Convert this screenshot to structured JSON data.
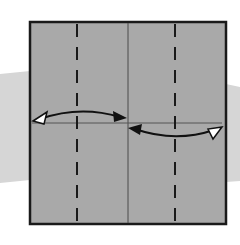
{
  "diagram": {
    "type": "origami-fold-step",
    "colors": {
      "background": "#ffffff",
      "band": "#d4d4d4",
      "paper": "#a9a9a9",
      "outline": "#1a1a1a",
      "crease": "#4a4a4a",
      "arrow": "#111111",
      "arrowhead_hollow": "#ffffff"
    },
    "paper": {
      "x": 30,
      "y": 22,
      "width": 196,
      "height": 202
    },
    "center_crease": {
      "x": 128
    },
    "horizontal_guide": {
      "y": 123
    },
    "valley_folds": [
      {
        "name": "left-valley-fold",
        "x": 77
      },
      {
        "name": "right-valley-fold",
        "x": 175
      }
    ],
    "arrows": [
      {
        "name": "left-fold-arrow",
        "from": "left edge",
        "to": "center"
      },
      {
        "name": "right-fold-arrow",
        "from": "right edge",
        "to": "center"
      }
    ]
  }
}
